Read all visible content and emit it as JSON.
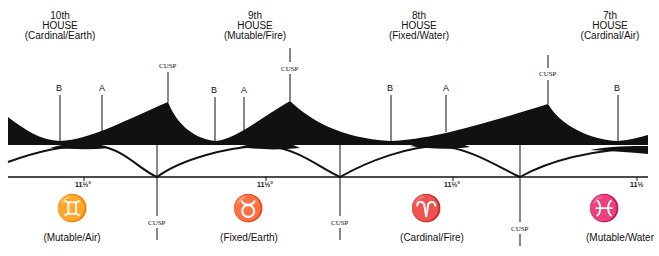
{
  "houses": [
    {
      "ordinal": "10th",
      "word": "HOUSE",
      "quality": "(Cardinal/Earth)"
    },
    {
      "ordinal": "9th",
      "word": "HOUSE",
      "quality": "(Mutable/Fire)"
    },
    {
      "ordinal": "8th",
      "word": "HOUSE",
      "quality": "(Fixed/Water)"
    },
    {
      "ordinal": "7th",
      "word": "HOUSE",
      "quality": "(Cardinal/Air)"
    }
  ],
  "signs": [
    {
      "glyph": "♊",
      "name": "gemini",
      "quality": "(Mutable/Air)"
    },
    {
      "glyph": "♉",
      "name": "taurus",
      "quality": "(Fixed/Earth)"
    },
    {
      "glyph": "♈",
      "name": "aries",
      "quality": "(Cardinal/Fire)"
    },
    {
      "glyph": "♓",
      "name": "pisces",
      "quality": "(Mutable/Water"
    }
  ],
  "labels": {
    "cusp": "CUSP",
    "point_a": "A",
    "point_b": "B",
    "tick": "11½°",
    "tick_cut": "11½"
  },
  "colors": {
    "ink": "#111111",
    "paper": "#ffffff"
  }
}
